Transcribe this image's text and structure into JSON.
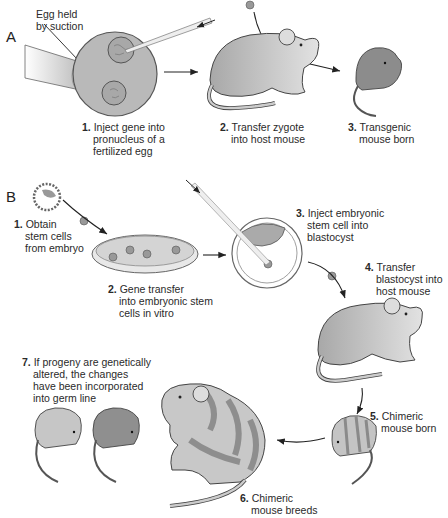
{
  "panel_a": {
    "letter": "A",
    "callout": [
      "Egg held",
      "by suction"
    ],
    "steps": [
      {
        "num": "1.",
        "lines": [
          "Inject gene into",
          "pronucleus of a",
          "fertilized egg"
        ]
      },
      {
        "num": "2.",
        "lines": [
          "Transfer zygote",
          "into host mouse"
        ]
      },
      {
        "num": "3.",
        "lines": [
          "Transgenic",
          "mouse born"
        ]
      }
    ]
  },
  "panel_b": {
    "letter": "B",
    "steps": [
      {
        "num": "1.",
        "lines": [
          "Obtain",
          "stem cells",
          "from embryo"
        ]
      },
      {
        "num": "2.",
        "lines": [
          "Gene transfer",
          "into embryonic stem",
          "cells in vitro"
        ]
      },
      {
        "num": "3.",
        "lines": [
          "Inject embryonic",
          "stem cell into",
          "blastocyst"
        ]
      },
      {
        "num": "4.",
        "lines": [
          "Transfer",
          "blastocyst into",
          "host mouse"
        ]
      },
      {
        "num": "5.",
        "lines": [
          "Chimeric",
          "mouse born"
        ]
      },
      {
        "num": "6.",
        "lines": [
          "Chimeric",
          "mouse breeds"
        ]
      },
      {
        "num": "7.",
        "lines": [
          "If progeny are genetically",
          "altered, the changes",
          "have been incorporated",
          "into germ line"
        ]
      }
    ]
  },
  "colors": {
    "egg": "#b8b8b8",
    "mouse_light": "#c8c8c8",
    "mouse_dark": "#8a8a8a",
    "stripe": "#a0a0a0",
    "outline": "#555555",
    "arrow": "#222222"
  }
}
